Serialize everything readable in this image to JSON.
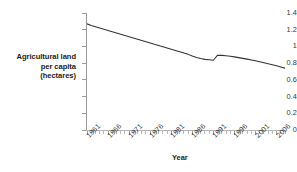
{
  "chart_data": {
    "type": "line",
    "title": "",
    "xlabel": "Year",
    "ylabel": "Agricultural land per capita (hectares)",
    "ylabel_lines": [
      "Agricultural land",
      "per capita",
      "(hectares)"
    ],
    "xlim": [
      1961,
      2008
    ],
    "ylim": [
      0,
      1.4
    ],
    "grid": false,
    "legend": false,
    "legend_position": "none",
    "line_color": "#333333",
    "y_ticks": [
      "0",
      "0.2",
      "0.4",
      "0.6",
      "0.8",
      "1",
      "1.2",
      "1.4"
    ],
    "y_tick_values": [
      0,
      0.2,
      0.4,
      0.6,
      0.8,
      1,
      1.2,
      1.4
    ],
    "x_ticks": [
      "1961",
      "1966",
      "1971",
      "1976",
      "1981",
      "1986",
      "1991",
      "1996",
      "2001",
      "2006"
    ],
    "x_tick_values": [
      1961,
      1966,
      1971,
      1976,
      1981,
      1986,
      1991,
      1996,
      2001,
      2006
    ],
    "annotations": [
      {
        "text": "discontinuity / upward jump between 1991 and 1992",
        "x": 1991.5,
        "y": 0.85
      }
    ],
    "series": [
      {
        "name": "Agricultural land per capita",
        "x": [
          1961,
          1962,
          1963,
          1964,
          1965,
          1966,
          1967,
          1968,
          1969,
          1970,
          1971,
          1972,
          1973,
          1974,
          1975,
          1976,
          1977,
          1978,
          1979,
          1980,
          1981,
          1982,
          1983,
          1984,
          1985,
          1986,
          1987,
          1988,
          1989,
          1990,
          1991,
          1992,
          1993,
          1994,
          1995,
          1996,
          1997,
          1998,
          1999,
          2000,
          2001,
          2002,
          2003,
          2004,
          2005,
          2006,
          2007,
          2008
        ],
        "values": [
          1.27,
          1.25,
          1.235,
          1.22,
          1.205,
          1.19,
          1.175,
          1.16,
          1.145,
          1.13,
          1.115,
          1.1,
          1.085,
          1.07,
          1.055,
          1.04,
          1.025,
          1.01,
          0.995,
          0.98,
          0.965,
          0.95,
          0.935,
          0.92,
          0.905,
          0.885,
          0.868,
          0.855,
          0.845,
          0.84,
          0.835,
          0.895,
          0.893,
          0.888,
          0.882,
          0.875,
          0.866,
          0.857,
          0.848,
          0.838,
          0.828,
          0.818,
          0.806,
          0.794,
          0.782,
          0.77,
          0.755,
          0.74
        ]
      }
    ]
  }
}
